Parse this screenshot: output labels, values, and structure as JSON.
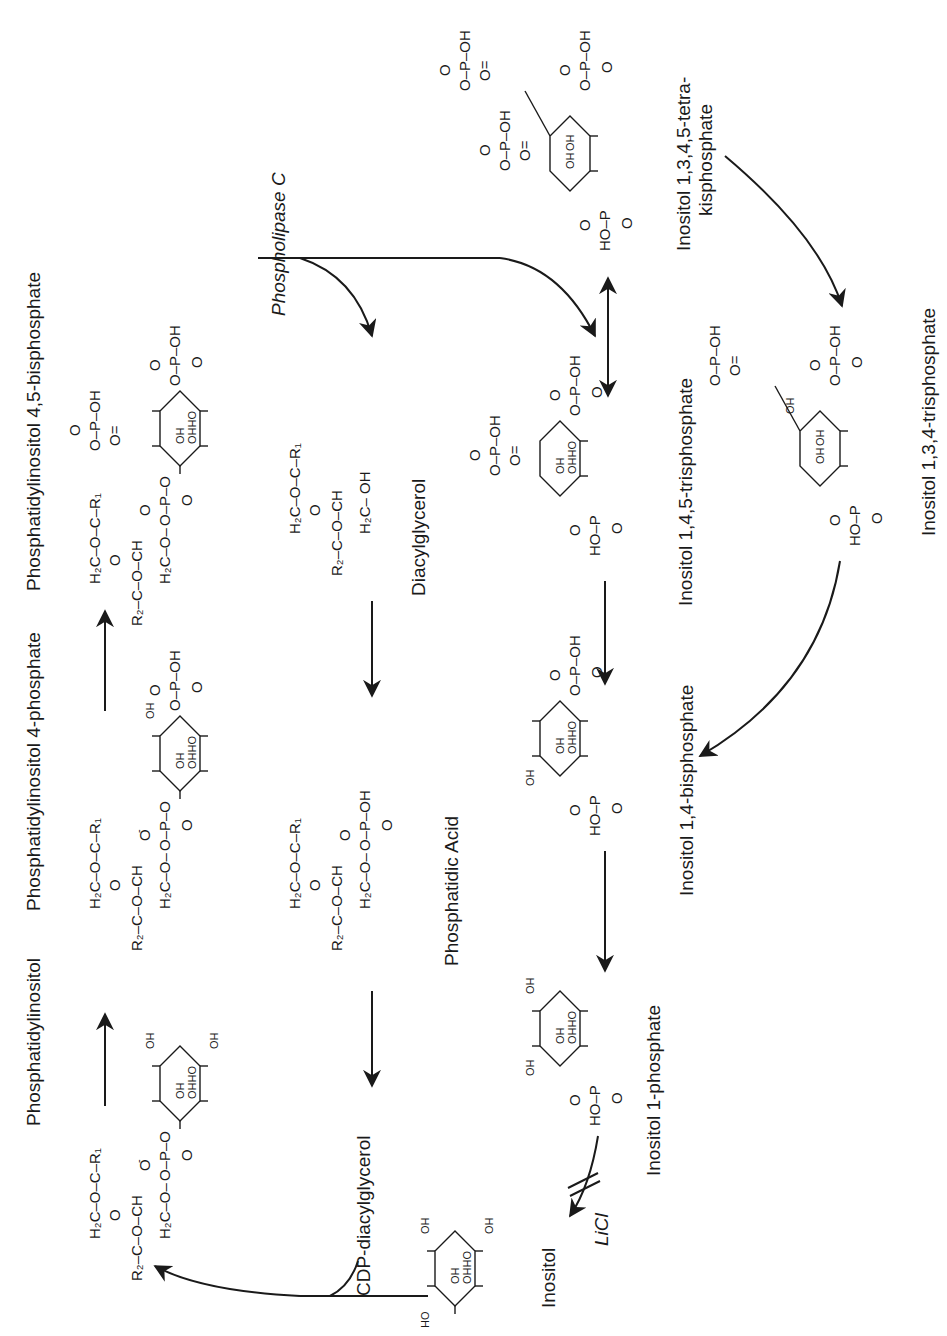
{
  "figure": {
    "orientation": "rotated 90° counterclockwise",
    "ink_color": "#1a1a1a",
    "background": "#ffffff"
  },
  "compounds": {
    "pi": {
      "label": "Phosphatidylinositol",
      "glycerol": [
        "O",
        "H2C–O–C–R1",
        "R2–C–O–CH",
        "H2C–O–P–O",
        "O⁻",
        "=O"
      ],
      "ring_substituents": [
        "OH",
        "OH",
        "OH",
        "OHHO",
        "OH"
      ]
    },
    "pi4p": {
      "label": "Phosphatidylinositol 4-phosphate",
      "phosphate": [
        "O⁻–P–OH",
        "O",
        "=O"
      ],
      "ring_substituents": [
        "OH",
        "OH",
        "OHHO"
      ]
    },
    "pip2": {
      "label": "Phosphatidylinositol 4,5-bisphosphate",
      "phosphates": [
        "O⁻–P–OH",
        "O=P–OH",
        "O⁻"
      ],
      "ring_substituents": [
        "OH",
        "OHHO"
      ]
    },
    "dag": {
      "label": "Diacylglycerol",
      "structure": [
        "O=C–R1",
        "H2C–O",
        "R2–C–O–CH",
        "H2C–OH"
      ]
    },
    "pa": {
      "label": "Phosphatidic Acid",
      "structure": [
        "O=C–R1",
        "H2C–O",
        "R2–C–O–CH",
        "H2C–O–P–OH",
        "O⁻",
        "=O"
      ]
    },
    "cdp_dag": {
      "label": "CDP-diacylglycerol"
    },
    "ip3": {
      "label": "Inositol 1,4,5-trisphosphate",
      "phosphates": [
        "O⁻–P–OH",
        "O=P–OH",
        "HO–P=O"
      ],
      "ring_substituents": [
        "OH",
        "OHHO"
      ]
    },
    "ip4": {
      "label_line1": "Inositol 1,3,4,5-tetra-",
      "label_line2": "kisphosphate",
      "phosphates": [
        "O⁻–P–OH",
        "O=P–O⁻",
        "O=P–OH",
        "HO–P=O"
      ],
      "ring_substituents": [
        "OH",
        "OH"
      ]
    },
    "ip3_134": {
      "label": "Inositol 1,3,4-trisphosphate",
      "phosphates": [
        "O=P–OH",
        "O⁻–P–OH",
        "HO–P=O"
      ],
      "ring_substituents": [
        "OH",
        "OH",
        "OH"
      ]
    },
    "ip2": {
      "label": "Inositol 1,4-bisphosphate",
      "phosphates": [
        "O⁻–P–OH",
        "HO–P=O"
      ],
      "ring_substituents": [
        "OH",
        "OH",
        "OHHO"
      ]
    },
    "ip1": {
      "label": "Inositol 1-phosphate",
      "phosphates": [
        "HO–P=O"
      ],
      "ring_substituents": [
        "OH",
        "OH",
        "OH",
        "OHHO"
      ]
    },
    "inositol": {
      "label": "Inositol",
      "ring_substituents": [
        "OH",
        "OH",
        "HO",
        "OH",
        "OHHO"
      ]
    }
  },
  "enzymes": {
    "plc": "Phospholipase C",
    "inhibitor": "LiCl"
  },
  "chem_text": {
    "O": "O",
    "Om": "O",
    "minus": "-",
    "P": "P",
    "OH": "OH",
    "HO": "HO",
    "OHHO": "OHHO",
    "H2C_O_C_R1": "H₂C–O–C–R₁",
    "R2_C_O_CH": "R₂–C–O–CH",
    "H2C_O": "H₂C–O–",
    "H2C_OH": "H₂C– OH",
    "eq": "=",
    "dash": "–",
    "O_P_OH": "O–P–OH",
    "O_P_O": "O–P–O",
    "HO_P": "HO–P",
    "O_eq": "O=",
    "C_R1": "C–R₁"
  },
  "reactions": [
    {
      "from": "pi",
      "to": "pi4p",
      "type": "arrow"
    },
    {
      "from": "pi4p",
      "to": "pip2",
      "type": "arrow"
    },
    {
      "from": "pip2",
      "to": "ip3",
      "type": "arrow",
      "enzyme": "Phospholipase C"
    },
    {
      "from": "pip2",
      "to": "dag",
      "type": "curved-arrow"
    },
    {
      "from": "dag",
      "to": "pa",
      "type": "arrow"
    },
    {
      "from": "pa",
      "to": "cdp_dag",
      "type": "arrow"
    },
    {
      "from": "ip3",
      "to": "ip4",
      "type": "double-arrow"
    },
    {
      "from": "ip4",
      "to": "ip3_134",
      "type": "curved-arrow"
    },
    {
      "from": "ip3_134",
      "to": "ip2",
      "type": "curved-arrow"
    },
    {
      "from": "ip3",
      "to": "ip2",
      "type": "arrow"
    },
    {
      "from": "ip2",
      "to": "ip1",
      "type": "arrow"
    },
    {
      "from": "ip1",
      "to": "inositol",
      "type": "curved-arrow",
      "inhibited_by": "LiCl"
    },
    {
      "from": "inositol",
      "to": "pi",
      "type": "curved-arrow",
      "with": "cdp_dag"
    }
  ]
}
